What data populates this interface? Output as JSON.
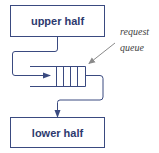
{
  "diagram": {
    "colors": {
      "box_stroke": "#3a4a80",
      "line": "#3a4a80",
      "text": "#2e3a6e",
      "annotation": "#444444",
      "pointer": "#8a8a8a"
    },
    "nodes": [
      {
        "id": "upper",
        "label": "upper half"
      },
      {
        "id": "lower",
        "label": "lower half"
      }
    ],
    "queue": {
      "cells": 4
    },
    "annotation": {
      "line1": "request",
      "line2": "queue"
    },
    "edges": [
      {
        "from": "upper",
        "to": "queue"
      },
      {
        "from": "queue",
        "to": "lower"
      }
    ]
  }
}
